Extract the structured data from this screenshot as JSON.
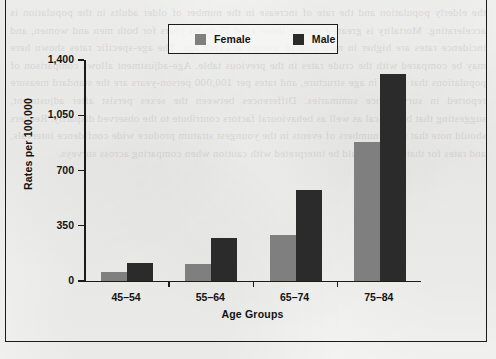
{
  "figure": {
    "background_color": "#f2f2f0",
    "frame_color": "#1b1b1b"
  },
  "legend": {
    "position": "top-center",
    "entries": [
      {
        "label": "Female",
        "color": "#7f7f7f",
        "swatch_icon": "legend-swatch-icon"
      },
      {
        "label": "Male",
        "color": "#2b2b2b",
        "swatch_icon": "legend-swatch-icon"
      }
    ]
  },
  "axes": {
    "y_title": "Rates per 100,000",
    "x_title": "Age Groups",
    "y_ticks": [
      "0",
      "350",
      "700",
      "1,050",
      "1,400"
    ],
    "x_ticks": [
      "45–54",
      "55–64",
      "65–74",
      "75–84"
    ]
  },
  "chart_data": {
    "type": "bar",
    "title": "",
    "subtitle": "",
    "xlabel": "Age Groups",
    "ylabel": "Rates per 100,000",
    "categories": [
      "45–54",
      "55–64",
      "65–74",
      "75–84"
    ],
    "series": [
      {
        "name": "Female",
        "color": "#7f7f7f",
        "values": [
          57,
          108,
          293,
          878
        ]
      },
      {
        "name": "Male",
        "color": "#2b2b2b",
        "values": [
          115,
          274,
          579,
          1311
        ]
      }
    ],
    "ylim": [
      0,
      1400
    ],
    "ytick_values": [
      0,
      350,
      700,
      1050,
      1400
    ],
    "grid": false,
    "legend_position": "top-center",
    "bar_orientation": "vertical",
    "grouping": "clustered"
  },
  "ghost_text": "the elderly population and the rate of increase in the number of older adults in the population is accelerating. Mortality is greatest among those aged 75 to 84 years for both men and women, and incidence rates are higher in men than in women at every age. The age-specific rates shown here may be compared with the crude rates in the previous table. Age-adjustment allows comparison of populations that differ in age structure, and rates per 100,000 person-years are the standard measure reported in surveillance summaries. Differences between the sexes persist after adjustment, suggesting that biological as well as behavioural factors contribute to the observed disparity. Readers should note that small numbers of events in the youngest stratum produce wide confidence intervals, and rates for that group should be interpreted with caution when comparing across surveys."
}
